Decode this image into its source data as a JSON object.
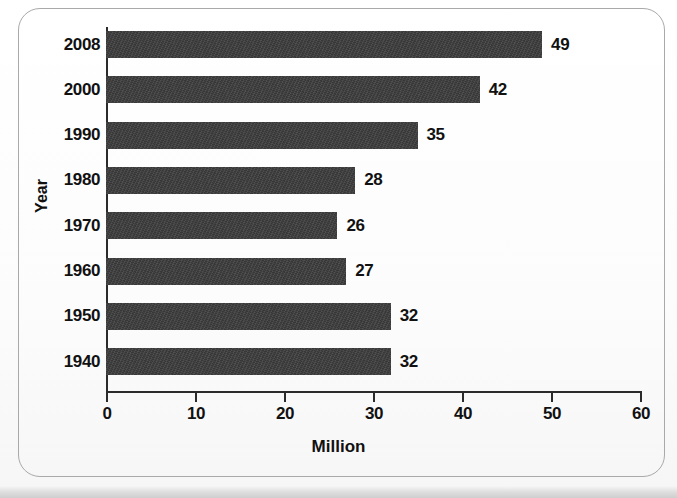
{
  "chart_data": {
    "type": "bar",
    "orientation": "horizontal",
    "title": "",
    "xlabel": "Million",
    "ylabel": "Year",
    "categories": [
      "2008",
      "2000",
      "1990",
      "1980",
      "1970",
      "1960",
      "1950",
      "1940"
    ],
    "values": [
      49,
      42,
      35,
      28,
      26,
      27,
      32,
      32
    ],
    "value_labels": [
      "49",
      "42",
      "35",
      "28",
      "26",
      "27",
      "32",
      "32"
    ],
    "xlim": [
      0,
      60
    ],
    "xticks": [
      0,
      10,
      20,
      30,
      40,
      50,
      60
    ],
    "xtick_labels": [
      "0",
      "10",
      "20",
      "30",
      "40",
      "50",
      "60"
    ],
    "grid": false,
    "legend": null,
    "bar_color": "#3c3c3c",
    "axis_color": "#2b2b2b",
    "text_color": "#111111",
    "background": "#fdfdfd",
    "frame_color": "#a9a9a9"
  }
}
